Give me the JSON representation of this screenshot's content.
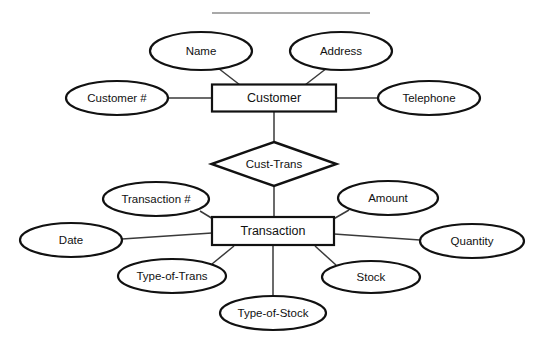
{
  "diagram": {
    "type": "entity-relationship-diagram",
    "title_rule": {
      "visible": true,
      "x1": 212,
      "y1": 13,
      "x2": 370,
      "y2": 13
    },
    "entities": [
      {
        "id": "customer",
        "label": "Customer",
        "shape": "rectangle",
        "cx": 274,
        "cy": 98,
        "w": 124,
        "h": 27
      },
      {
        "id": "transaction",
        "label": "Transaction",
        "shape": "rectangle",
        "cx": 273,
        "cy": 231,
        "w": 122,
        "h": 28
      }
    ],
    "relationships": [
      {
        "id": "cust-trans",
        "label": "Cust-Trans",
        "shape": "diamond",
        "cx": 274,
        "cy": 164,
        "w": 125,
        "h": 44,
        "connects": [
          "customer",
          "transaction"
        ]
      }
    ],
    "attributes": [
      {
        "id": "name",
        "label": "Name",
        "owner": "customer",
        "cx": 201,
        "cy": 51,
        "rx": 51,
        "ry": 19
      },
      {
        "id": "address",
        "label": "Address",
        "owner": "customer",
        "cx": 341,
        "cy": 51,
        "rx": 51,
        "ry": 19
      },
      {
        "id": "customer-number",
        "label": "Customer #",
        "owner": "customer",
        "cx": 117,
        "cy": 98,
        "rx": 51,
        "ry": 17
      },
      {
        "id": "telephone",
        "label": "Telephone",
        "owner": "customer",
        "cx": 429,
        "cy": 98,
        "rx": 51,
        "ry": 17
      },
      {
        "id": "transaction-number",
        "label": "Transaction #",
        "owner": "transaction",
        "cx": 156,
        "cy": 199,
        "rx": 53,
        "ry": 17
      },
      {
        "id": "amount",
        "label": "Amount",
        "owner": "transaction",
        "cx": 388,
        "cy": 198,
        "rx": 50,
        "ry": 17
      },
      {
        "id": "date",
        "label": "Date",
        "owner": "transaction",
        "cx": 71,
        "cy": 240,
        "rx": 51,
        "ry": 17
      },
      {
        "id": "quantity",
        "label": "Quantity",
        "owner": "transaction",
        "cx": 472,
        "cy": 241,
        "rx": 52,
        "ry": 17
      },
      {
        "id": "type-of-trans",
        "label": "Type-of-Trans",
        "owner": "transaction",
        "cx": 172,
        "cy": 276,
        "rx": 54,
        "ry": 17
      },
      {
        "id": "stock",
        "label": "Stock",
        "owner": "transaction",
        "cx": 371,
        "cy": 277,
        "rx": 49,
        "ry": 16
      },
      {
        "id": "type-of-stock",
        "label": "Type-of-Stock",
        "owner": "transaction",
        "cx": 273,
        "cy": 313,
        "rx": 53,
        "ry": 17
      }
    ],
    "edges": [
      {
        "id": "edge-name-customer",
        "from": "name",
        "to": "customer",
        "x1": 218,
        "y1": 68,
        "x2": 240,
        "y2": 85
      },
      {
        "id": "edge-address-customer",
        "from": "address",
        "to": "customer",
        "x1": 327,
        "y1": 68,
        "x2": 305,
        "y2": 85
      },
      {
        "id": "edge-customernumber-customer",
        "from": "customer-number",
        "to": "customer",
        "x1": 168,
        "y1": 98,
        "x2": 212,
        "y2": 98
      },
      {
        "id": "edge-telephone-customer",
        "from": "telephone",
        "to": "customer",
        "x1": 336,
        "y1": 98,
        "x2": 378,
        "y2": 98
      },
      {
        "id": "edge-customer-relationship",
        "from": "customer",
        "to": "cust-trans",
        "x1": 274,
        "y1": 111,
        "x2": 274,
        "y2": 143
      },
      {
        "id": "edge-relationship-transaction",
        "from": "cust-trans",
        "to": "transaction",
        "x1": 274,
        "y1": 186,
        "x2": 274,
        "y2": 218
      },
      {
        "id": "edge-transactionnumber-transaction",
        "from": "transaction-number",
        "to": "transaction",
        "x1": 200,
        "y1": 211,
        "x2": 218,
        "y2": 222
      },
      {
        "id": "edge-amount-transaction",
        "from": "amount",
        "to": "transaction",
        "x1": 349,
        "y1": 210,
        "x2": 330,
        "y2": 221
      },
      {
        "id": "edge-date-transaction",
        "from": "date",
        "to": "transaction",
        "x1": 122,
        "y1": 239,
        "x2": 212,
        "y2": 233
      },
      {
        "id": "edge-quantity-transaction",
        "from": "quantity",
        "to": "transaction",
        "x1": 334,
        "y1": 234,
        "x2": 420,
        "y2": 240
      },
      {
        "id": "edge-typeoftrans-transaction",
        "from": "type-of-trans",
        "to": "transaction",
        "x1": 212,
        "y1": 264,
        "x2": 234,
        "y2": 246
      },
      {
        "id": "edge-stock-transaction",
        "from": "stock",
        "to": "transaction",
        "x1": 336,
        "y1": 265,
        "x2": 315,
        "y2": 246
      },
      {
        "id": "edge-typeofstock-transaction",
        "from": "type-of-stock",
        "to": "transaction",
        "x1": 273,
        "y1": 296,
        "x2": 273,
        "y2": 246
      }
    ],
    "colors": {
      "background": "#ffffff",
      "stroke": "#111111",
      "edge_stroke": "#3a3a3a",
      "rule_stroke": "#8d8d8d",
      "text": "#111111"
    }
  }
}
